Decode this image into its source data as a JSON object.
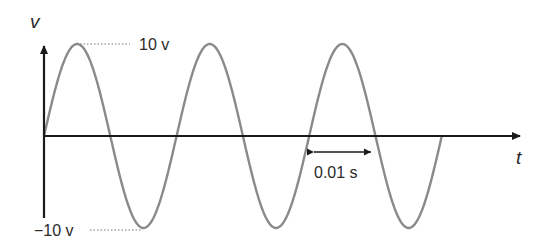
{
  "diagram": {
    "axes": {
      "y_label": "v",
      "x_label": "t"
    },
    "annotations": {
      "peak_label": "10 v",
      "trough_label": "−10 v",
      "half_period_label": "0.01 s"
    },
    "colors": {
      "axis": "#1a1a1a",
      "wave": "#8a8a8a",
      "text": "#2a2a2a"
    }
  },
  "chart_data": {
    "type": "line",
    "title": "",
    "xlabel": "t",
    "ylabel": "v",
    "amplitude": 10,
    "half_period_s": 0.01,
    "period_s": 0.02,
    "cycles_shown": 3,
    "x": [
      0,
      0.005,
      0.01,
      0.015,
      0.02,
      0.025,
      0.03,
      0.035,
      0.04,
      0.045,
      0.05,
      0.055,
      0.06
    ],
    "values": [
      0,
      10,
      0,
      -10,
      0,
      10,
      0,
      -10,
      0,
      10,
      0,
      -10,
      0
    ],
    "ylim": [
      -10,
      10
    ],
    "annotations": [
      "10 v",
      "−10 v",
      "0.01 s"
    ],
    "grid": false
  }
}
